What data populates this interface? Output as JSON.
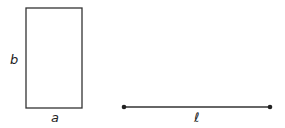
{
  "rectangle": {
    "label_width": "a",
    "label_height": "b"
  },
  "segment": {
    "label": "ℓ"
  },
  "colors": {
    "stroke": "#333333",
    "text": "#222222",
    "background": "#ffffff"
  }
}
